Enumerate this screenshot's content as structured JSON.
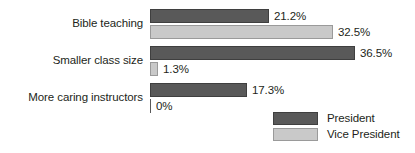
{
  "chart_data": {
    "type": "bar",
    "title": "",
    "subtitle": "",
    "xlabel": "",
    "ylabel": "",
    "orientation": "horizontal",
    "grid": false,
    "legend_position": "bottom-right",
    "xlim": [
      0,
      36.5
    ],
    "categories": [
      "Bible teaching",
      "Smaller class size",
      "More caring instructors"
    ],
    "series": [
      {
        "name": "President",
        "color": "#595959",
        "values": [
          21.2,
          36.5,
          17.3
        ],
        "labels": [
          "21.2%",
          "36.5%",
          "17.3%"
        ]
      },
      {
        "name": "Vice President",
        "color": "#c9c9c9",
        "values": [
          32.5,
          1.3,
          0
        ],
        "labels": [
          "32.5%",
          "1.3%",
          "0%"
        ]
      }
    ]
  },
  "legend": {
    "items": [
      {
        "label": "President",
        "color": "#595959"
      },
      {
        "label": "Vice President",
        "color": "#c9c9c9"
      }
    ]
  }
}
